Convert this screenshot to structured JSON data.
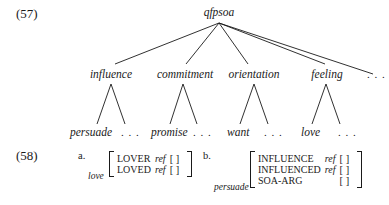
{
  "example57": {
    "number": "(57)",
    "root": "qfpsoa",
    "children": [
      {
        "label": "influence",
        "leaf": "persuade",
        "more": ". . ."
      },
      {
        "label": "commitment",
        "leaf": "promise",
        "more": ". . ."
      },
      {
        "label": "orientation",
        "leaf": "want",
        "more": ". . ."
      },
      {
        "label": "feeling",
        "leaf": "love",
        "more": ". . ."
      }
    ],
    "more": ". . ."
  },
  "example58": {
    "number": "(58)",
    "a": {
      "label": "a.",
      "tag": "love",
      "rows": [
        {
          "feature": "LOVER",
          "ref": "ref",
          "value": "[  ]"
        },
        {
          "feature": "LOVED",
          "ref": "ref",
          "value": "[  ]"
        }
      ]
    },
    "b": {
      "label": "b.",
      "tag": "persuade",
      "rows": [
        {
          "feature": "INFLUENCE",
          "ref": "ref",
          "value": "[  ]"
        },
        {
          "feature": "INFLUENCED",
          "ref": "ref",
          "value": "[  ]"
        },
        {
          "feature": "SOA-ARG",
          "ref": "",
          "value": "[  ]"
        }
      ]
    }
  }
}
